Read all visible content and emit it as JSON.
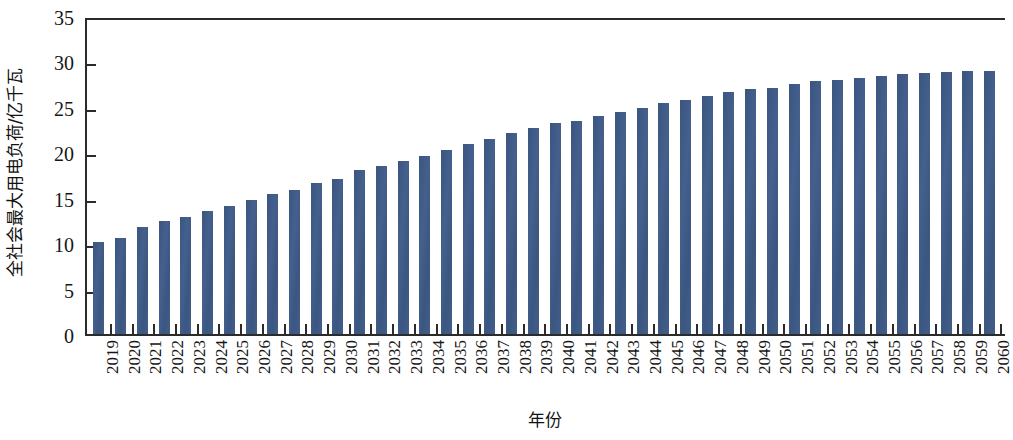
{
  "chart_data": {
    "type": "bar",
    "title": "",
    "xlabel": "年份",
    "ylabel": "全社会最大用电负荷/亿千瓦",
    "ylim": [
      0,
      35
    ],
    "yticks": [
      0,
      5,
      10,
      15,
      20,
      25,
      30,
      35
    ],
    "grid": false,
    "legend": null,
    "bar_color": "#3e5a85",
    "axis_color": "#2b2b2b",
    "categories": [
      "2019",
      "2020",
      "2021",
      "2022",
      "2023",
      "2024",
      "2025",
      "2026",
      "2027",
      "2028",
      "2029",
      "2030",
      "2031",
      "2032",
      "2033",
      "2034",
      "2035",
      "2036",
      "2037",
      "2038",
      "2039",
      "2040",
      "2041",
      "2042",
      "2043",
      "2044",
      "2045",
      "2046",
      "2047",
      "2048",
      "2049",
      "2050",
      "2051",
      "2052",
      "2053",
      "2054",
      "2055",
      "2056",
      "2057",
      "2058",
      "2059",
      "2060"
    ],
    "values": [
      10.1,
      10.6,
      11.8,
      12.4,
      12.9,
      13.5,
      14.1,
      14.7,
      15.4,
      15.9,
      16.6,
      17.1,
      18.0,
      18.5,
      19.0,
      19.6,
      20.2,
      20.9,
      21.5,
      22.1,
      22.7,
      23.2,
      23.5,
      24.0,
      24.4,
      24.9,
      25.4,
      25.8,
      26.2,
      26.6,
      27.0,
      27.1,
      27.5,
      27.8,
      28.0,
      28.2,
      28.4,
      28.6,
      28.7,
      28.8,
      28.9,
      29.0
    ]
  }
}
